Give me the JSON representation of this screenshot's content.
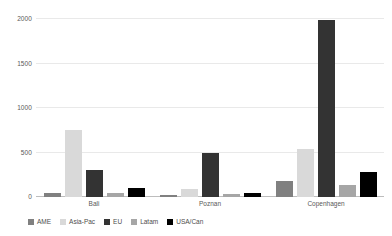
{
  "chart_data": {
    "type": "bar",
    "title": "",
    "subtitle": "",
    "xlabel": "",
    "ylabel": "",
    "categories": [
      "Bali",
      "Poznan",
      "Copenhagen"
    ],
    "series": [
      {
        "name": "AME",
        "color": "#808080",
        "values": [
          50,
          20,
          180
        ]
      },
      {
        "name": "Asia-Pac",
        "color": "#d9d9d9",
        "values": [
          750,
          90,
          535
        ]
      },
      {
        "name": "EU",
        "color": "#333333",
        "values": [
          300,
          490,
          1990
        ]
      },
      {
        "name": "Latam",
        "color": "#a6a6a6",
        "values": [
          40,
          35,
          130
        ]
      },
      {
        "name": "USA/Can",
        "color": "#000000",
        "values": [
          100,
          45,
          280
        ]
      }
    ],
    "ylim": [
      0,
      2000
    ],
    "yticks": [
      0,
      500,
      1000,
      1500,
      2000
    ],
    "ytick_labels": [
      "0",
      "500",
      "1000",
      "1500",
      "2000"
    ],
    "grid": true,
    "legend_position": "bottom-left",
    "axis_color": "#bdbdbd",
    "gridline_color": "#e9e9e9",
    "tick_label_color": "#595959",
    "background_color": "#ffffff"
  }
}
